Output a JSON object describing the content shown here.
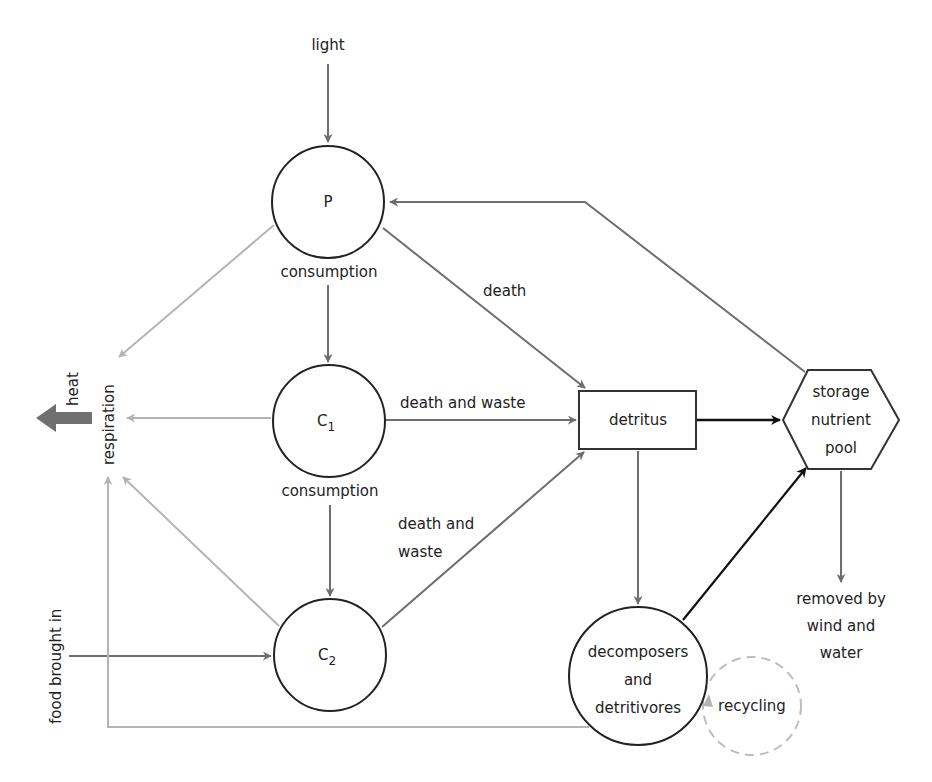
{
  "diagram": {
    "type": "ecosystem nutrient/energy flow",
    "colors": {
      "dark_arrow": "#111111",
      "mid_arrow": "#6e6e6e",
      "light_arrow": "#b4b4b4",
      "heat_arrow": "#707070",
      "node_stroke": "#222222",
      "node_fill": "#ffffff"
    },
    "nodes": {
      "producer": {
        "label": "P"
      },
      "c1": {
        "label": "C",
        "sub": "1"
      },
      "c2": {
        "label": "C",
        "sub": "2"
      },
      "detritus": {
        "label": "detritus"
      },
      "storage": {
        "lines": [
          "storage",
          "nutrient",
          "pool"
        ]
      },
      "decomposers": {
        "lines": [
          "decomposers",
          "and",
          "detritivores"
        ]
      },
      "recycling": {
        "label": "recycling"
      }
    },
    "labels": {
      "light": "light",
      "consumption_1": "consumption",
      "consumption_2": "consumption",
      "death": "death",
      "death_and_waste_c1": "death and waste",
      "death_and_waste_c2_line1": "death and",
      "death_and_waste_c2_line2": "waste",
      "heat": "heat",
      "respiration": "respiration",
      "food_brought_in": "food brought in",
      "removed_line1": "removed by",
      "removed_line2": "wind and",
      "removed_line3": "water"
    }
  }
}
